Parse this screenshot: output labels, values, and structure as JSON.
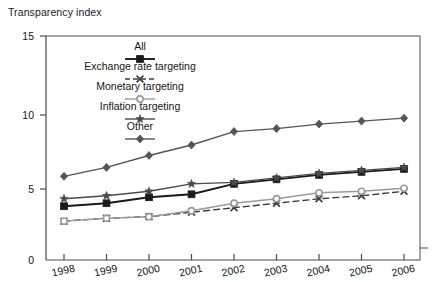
{
  "chart_data": {
    "type": "line",
    "title": "Transparency index",
    "xlabel": "",
    "ylabel": "",
    "ylim": [
      0,
      15
    ],
    "yticks": [
      0,
      5,
      10,
      15
    ],
    "ytick_labels": [
      "0",
      "5",
      "10",
      "15"
    ],
    "grid": false,
    "legend_position": "inside-top-center",
    "categories": [
      "1998",
      "1999",
      "2000",
      "2001",
      "2002",
      "2003",
      "2004",
      "2005",
      "2006"
    ],
    "x": [
      1998,
      1999,
      2000,
      2001,
      2002,
      2003,
      2004,
      2005,
      2006
    ],
    "series": [
      {
        "name": "All",
        "marker": "filled-square",
        "line_style": "solid",
        "color": "#1a1a1a",
        "values": [
          3.6,
          3.8,
          4.2,
          4.4,
          5.1,
          5.4,
          5.7,
          5.9,
          6.1
        ]
      },
      {
        "name": "Exchange rate targeting",
        "marker": "x-cross",
        "line_style": "dashed",
        "color": "#3d3d3d",
        "values": [
          2.6,
          2.8,
          2.9,
          3.2,
          3.5,
          3.8,
          4.1,
          4.3,
          4.6
        ]
      },
      {
        "name": "Monetary targeting",
        "marker": "open-circle",
        "line_style": "solid",
        "color": "#9a9a9a",
        "values": [
          2.6,
          2.8,
          2.9,
          3.3,
          3.8,
          4.1,
          4.5,
          4.6,
          4.8
        ]
      },
      {
        "name": "Inflation targeting",
        "marker": "filled-star",
        "line_style": "solid",
        "color": "#4a4a4a",
        "values": [
          4.1,
          4.3,
          4.6,
          5.1,
          5.2,
          5.5,
          5.8,
          6.0,
          6.2
        ]
      },
      {
        "name": "Other",
        "marker": "filled-diamond",
        "line_style": "solid",
        "color": "#555555",
        "values": [
          5.6,
          6.2,
          7.0,
          7.7,
          8.6,
          8.8,
          9.1,
          9.3,
          9.5
        ]
      }
    ]
  },
  "legend": {
    "items": [
      {
        "label": "All"
      },
      {
        "label": "Exchange rate targeting"
      },
      {
        "label": "Monetary targeting"
      },
      {
        "label": "Inflation targeting"
      },
      {
        "label": "Other"
      }
    ]
  },
  "axes": {
    "y_tick_15": "15",
    "y_tick_10": "10",
    "y_tick_5": "5",
    "y_tick_0": "0"
  }
}
